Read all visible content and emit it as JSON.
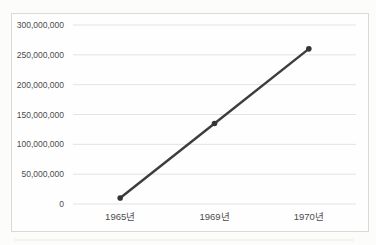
{
  "window": {
    "background_color": "#fcfcfb"
  },
  "chart": {
    "frame": {
      "border_color": "#d9d9d6",
      "background_color": "#fefefe"
    },
    "colors": {
      "gridline": "#e3e3e0",
      "series_line": "#3d3d3d",
      "marker": "#343434",
      "tick_text": "#4c4c4c"
    }
  },
  "chart_data": {
    "type": "line",
    "title": "",
    "xlabel": "",
    "ylabel": "",
    "categories": [
      "1965년",
      "1969년",
      "1970년"
    ],
    "series": [
      {
        "name": "series-1",
        "values": [
          10000000,
          135000000,
          260000000
        ]
      }
    ],
    "ylim": [
      0,
      300000000
    ],
    "ytick_interval": 50000000,
    "ytick_labels": [
      "0",
      "50,000,000",
      "100,000,000",
      "150,000,000",
      "200,000,000",
      "250,000,000",
      "300,000,000"
    ],
    "grid": "horizontal",
    "legend": "none",
    "marker_style": "round"
  }
}
